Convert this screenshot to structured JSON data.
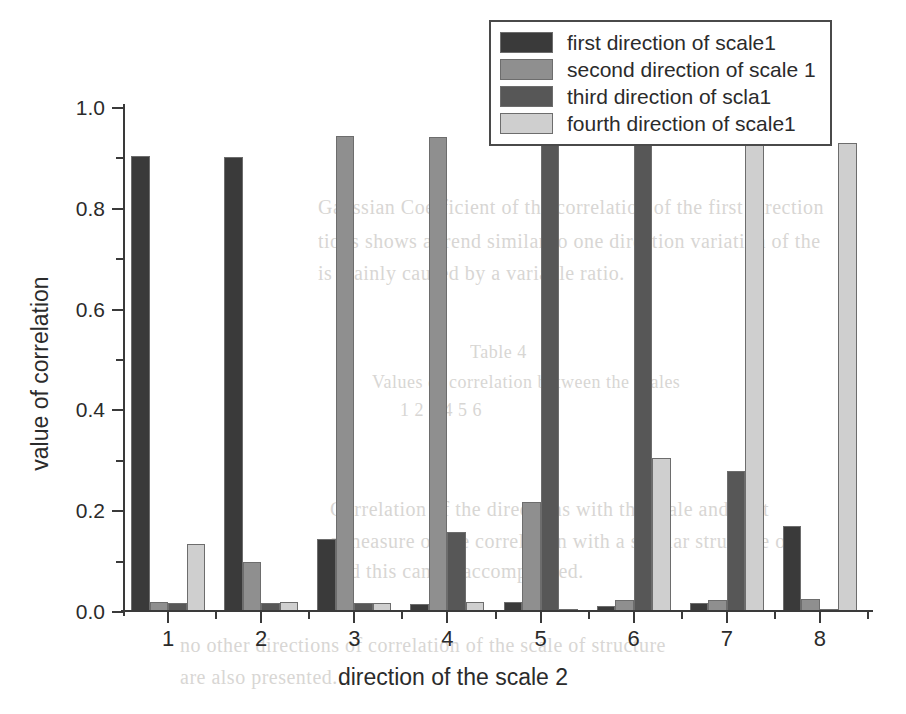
{
  "chart_data": {
    "type": "bar",
    "title": "",
    "xlabel": "direction of the scale 2",
    "ylabel": "value of correlation",
    "categories": [
      "1",
      "2",
      "3",
      "4",
      "5",
      "6",
      "7",
      "8"
    ],
    "ylim": [
      0.0,
      1.0
    ],
    "ytick_labels": [
      "0.0",
      "0.2",
      "0.4",
      "0.6",
      "0.8",
      "1.0"
    ],
    "ytick_values": [
      0.0,
      0.2,
      0.4,
      0.6,
      0.8,
      1.0
    ],
    "yminor_values": [
      0.1,
      0.3,
      0.5,
      0.7,
      0.9
    ],
    "grid": false,
    "legend_position": "top-right",
    "series": [
      {
        "name": "first direction of scale1",
        "color": "#3a3a3a",
        "values": [
          0.905,
          0.903,
          0.145,
          0.015,
          0.02,
          0.012,
          0.018,
          0.17
        ]
      },
      {
        "name": "second direction of scale 1",
        "color": "#8f8f8f",
        "values": [
          0.02,
          0.099,
          0.945,
          0.942,
          0.218,
          0.023,
          0.024,
          0.025
        ]
      },
      {
        "name": "third direction of scla1",
        "color": "#575757",
        "values": [
          0.018,
          0.017,
          0.018,
          0.158,
          0.94,
          0.955,
          0.28,
          0.005
        ]
      },
      {
        "name": "fourth direction of scale1",
        "color": "#cfcfcf",
        "values": [
          0.135,
          0.02,
          0.018,
          0.02,
          0.005,
          0.305,
          0.97,
          0.93
        ]
      }
    ]
  },
  "legend": {
    "items": [
      {
        "label": "first direction of scale1"
      },
      {
        "label": "second direction of scale 1"
      },
      {
        "label": "third direction of scla1"
      },
      {
        "label": "fourth direction of scale1"
      }
    ]
  },
  "bleed_text": [
    {
      "text": "Gaussian   Coefficient   of   the   correlation   of   the   first   direction",
      "x": 318,
      "y": 196,
      "size": 20
    },
    {
      "text": "tions  shows  a  trend  similar  to  one  direction  variation  of  the",
      "x": 318,
      "y": 230,
      "size": 20
    },
    {
      "text": "is mainly caused by a  variable  ratio.",
      "x": 318,
      "y": 262,
      "size": 20
    },
    {
      "text": "Table 4",
      "x": 470,
      "y": 342,
      "size": 18
    },
    {
      "text": "Values of correlation between the scales",
      "x": 372,
      "y": 372,
      "size": 18
    },
    {
      "text": "1     2      3      4      5      6",
      "x": 400,
      "y": 400,
      "size": 18
    },
    {
      "text": "Correlation of the directions with the scale and first",
      "x": 330,
      "y": 498,
      "size": 20
    },
    {
      "text": "a measure of the correlation  with  a  similar  structure  of",
      "x": 330,
      "y": 530,
      "size": 20
    },
    {
      "text": "and this can be accomplished.",
      "x": 330,
      "y": 560,
      "size": 20
    },
    {
      "text": "no  other  directions  of  correlation  of  the  scale  of  structure",
      "x": 180,
      "y": 634,
      "size": 20
    },
    {
      "text": "are  also  presented.",
      "x": 180,
      "y": 666,
      "size": 20
    },
    {
      "text": "of  scale  is",
      "x": 660,
      "y": 94,
      "size": 18
    }
  ]
}
